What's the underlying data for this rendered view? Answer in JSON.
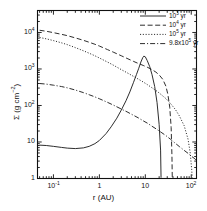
{
  "figure": {
    "background": "#ffffff",
    "frame_color": "#111111",
    "curve_color": "#222222"
  },
  "axes": {
    "xlabel": "r (AU)",
    "ylabel_prefix": "Σ (g cm",
    "ylabel_sup": "−2",
    "ylabel_suffix": ")",
    "x_scale": "log",
    "y_scale": "log",
    "xlim": [
      0.045,
      130
    ],
    "ylim": [
      1,
      40000
    ],
    "x_ticks": [
      {
        "value": 0.1,
        "mantissa": "10",
        "exponent": "-1"
      },
      {
        "value": 1,
        "mantissa": "1",
        "exponent": ""
      },
      {
        "value": 10,
        "mantissa": "10",
        "exponent": ""
      },
      {
        "value": 100,
        "mantissa": "10",
        "exponent": "2"
      }
    ],
    "y_ticks": [
      {
        "value": 1,
        "mantissa": "1",
        "exponent": ""
      },
      {
        "value": 10,
        "mantissa": "10",
        "exponent": ""
      },
      {
        "value": 100,
        "mantissa": "10",
        "exponent": "2"
      },
      {
        "value": 1000,
        "mantissa": "10",
        "exponent": "3"
      },
      {
        "value": 10000,
        "mantissa": "10",
        "exponent": "4"
      }
    ],
    "ticks_direction": "in",
    "minor_ticks": true,
    "grid": false
  },
  "legend": {
    "position": "top-right",
    "entries": [
      {
        "label_mantissa": "10",
        "label_exponent": "3",
        "label_suffix": " yr",
        "style": "solid"
      },
      {
        "label_mantissa": "10",
        "label_exponent": "4",
        "label_suffix": " yr",
        "style": "dashed"
      },
      {
        "label_mantissa": "10",
        "label_exponent": "5",
        "label_suffix": " yr",
        "style": "dotted"
      },
      {
        "label_mantissa": "9.8x10",
        "label_exponent": "5",
        "label_suffix": " yr",
        "style": "dashdot"
      }
    ]
  },
  "chart_data": {
    "type": "line",
    "title": "",
    "xlabel": "r (AU)",
    "ylabel": "Σ (g cm−2)",
    "xscale": "log",
    "yscale": "log",
    "xlim": [
      0.045,
      130
    ],
    "ylim": [
      1,
      40000
    ],
    "grid": false,
    "legend_position": "top-right",
    "series": [
      {
        "name": "10^3 yr",
        "style": "solid",
        "points": [
          [
            0.05,
            8.2
          ],
          [
            0.07,
            8.0
          ],
          [
            0.1,
            7.6
          ],
          [
            0.15,
            7.1
          ],
          [
            0.2,
            6.8
          ],
          [
            0.3,
            6.6
          ],
          [
            0.45,
            6.9
          ],
          [
            0.6,
            7.6
          ],
          [
            0.8,
            9.0
          ],
          [
            1.0,
            11.0
          ],
          [
            1.4,
            17
          ],
          [
            1.8,
            26
          ],
          [
            2.4,
            45
          ],
          [
            3.0,
            75
          ],
          [
            3.8,
            135
          ],
          [
            4.6,
            235
          ],
          [
            5.5,
            420
          ],
          [
            6.4,
            700
          ],
          [
            7.2,
            1050
          ],
          [
            8.0,
            1550
          ],
          [
            8.8,
            2050
          ],
          [
            9.3,
            2250
          ],
          [
            10.0,
            2150
          ],
          [
            11.0,
            1700
          ],
          [
            12.5,
            1150
          ],
          [
            14.0,
            700
          ],
          [
            16.0,
            330
          ],
          [
            18.0,
            120
          ],
          [
            20.0,
            30
          ],
          [
            21.5,
            6
          ],
          [
            22.0,
            1.05
          ]
        ]
      },
      {
        "name": "10^4 yr",
        "style": "dashed",
        "points": [
          [
            0.05,
            11500
          ],
          [
            0.07,
            10800
          ],
          [
            0.1,
            9900
          ],
          [
            0.15,
            8900
          ],
          [
            0.2,
            8200
          ],
          [
            0.3,
            7100
          ],
          [
            0.45,
            6100
          ],
          [
            0.6,
            5400
          ],
          [
            0.8,
            4750
          ],
          [
            1.0,
            4250
          ],
          [
            1.5,
            3400
          ],
          [
            2.0,
            2900
          ],
          [
            3.0,
            2300
          ],
          [
            4.0,
            1950
          ],
          [
            5.5,
            1620
          ],
          [
            7.0,
            1420
          ],
          [
            9.0,
            1250
          ],
          [
            11.0,
            1120
          ],
          [
            14.0,
            960
          ],
          [
            17.0,
            820
          ],
          [
            20.0,
            690
          ],
          [
            24.0,
            520
          ],
          [
            28.0,
            340
          ],
          [
            31.0,
            200
          ],
          [
            34.0,
            90
          ],
          [
            36.5,
            25
          ],
          [
            38.0,
            4
          ],
          [
            38.6,
            1.05
          ]
        ]
      },
      {
        "name": "10^5 yr",
        "style": "dotted",
        "points": [
          [
            0.05,
            7300
          ],
          [
            0.07,
            6700
          ],
          [
            0.1,
            6000
          ],
          [
            0.15,
            5200
          ],
          [
            0.2,
            4650
          ],
          [
            0.3,
            3850
          ],
          [
            0.45,
            3150
          ],
          [
            0.6,
            2700
          ],
          [
            0.8,
            2300
          ],
          [
            1.0,
            2000
          ],
          [
            1.5,
            1550
          ],
          [
            2.0,
            1280
          ],
          [
            3.0,
            960
          ],
          [
            4.0,
            790
          ],
          [
            5.5,
            630
          ],
          [
            7.0,
            530
          ],
          [
            9.0,
            440
          ],
          [
            11.0,
            375
          ],
          [
            14.0,
            305
          ],
          [
            18.0,
            245
          ],
          [
            22.0,
            200
          ],
          [
            28.0,
            155
          ],
          [
            35.0,
            115
          ],
          [
            45.0,
            78
          ],
          [
            55.0,
            52
          ],
          [
            70.0,
            28
          ],
          [
            85.0,
            12
          ],
          [
            95.0,
            5
          ],
          [
            102.0,
            1.8
          ],
          [
            105.0,
            1.05
          ]
        ]
      },
      {
        "name": "9.8x10^5 yr",
        "style": "dashdot",
        "points": [
          [
            0.05,
            400
          ],
          [
            0.07,
            385
          ],
          [
            0.1,
            360
          ],
          [
            0.15,
            330
          ],
          [
            0.2,
            305
          ],
          [
            0.3,
            265
          ],
          [
            0.45,
            225
          ],
          [
            0.6,
            197
          ],
          [
            0.8,
            172
          ],
          [
            1.0,
            153
          ],
          [
            1.5,
            122
          ],
          [
            2.0,
            103
          ],
          [
            3.0,
            80
          ],
          [
            4.0,
            67
          ],
          [
            5.5,
            54
          ],
          [
            7.0,
            46
          ],
          [
            9.0,
            38
          ],
          [
            11.0,
            33
          ],
          [
            14.0,
            27
          ],
          [
            18.0,
            22
          ],
          [
            22.0,
            18.5
          ],
          [
            28.0,
            15
          ],
          [
            35.0,
            12
          ],
          [
            45.0,
            9.2
          ],
          [
            55.0,
            7.5
          ],
          [
            70.0,
            5.9
          ],
          [
            85.0,
            4.9
          ],
          [
            100.0,
            4.1
          ],
          [
            115.0,
            3.6
          ],
          [
            128.0,
            3.2
          ]
        ]
      }
    ]
  }
}
